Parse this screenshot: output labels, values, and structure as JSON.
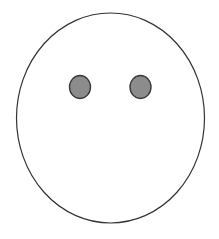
{
  "drawing": {
    "face": {
      "cx": 110.5,
      "cy": 118,
      "rx": 94,
      "ry": 105,
      "fill": "#ffffff",
      "stroke": "#333333"
    },
    "eyes": [
      {
        "cx": 80,
        "cy": 87,
        "rx": 10.5,
        "ry": 11.5,
        "fill": "#8c8c8c",
        "stroke": "#3a3a3a"
      },
      {
        "cx": 140.5,
        "cy": 87,
        "rx": 10.5,
        "ry": 11.5,
        "fill": "#8c8c8c",
        "stroke": "#3a3a3a"
      }
    ]
  }
}
